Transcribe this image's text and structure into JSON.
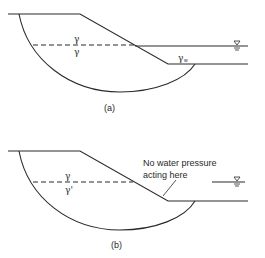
{
  "figure_a": {
    "caption": "(a)",
    "upper_label": "γ",
    "lower_label": "γ",
    "water_label": "γ",
    "water_label_sub": "w",
    "water_table_symbol": "∇"
  },
  "figure_b": {
    "caption": "(b)",
    "upper_label": "γ",
    "lower_label": "γ'",
    "annotation_line1": "No water pressure",
    "annotation_line2": "acting here",
    "water_table_symbol": "∇"
  },
  "colors": {
    "line": "#2a2a2a",
    "background": "#ffffff"
  }
}
